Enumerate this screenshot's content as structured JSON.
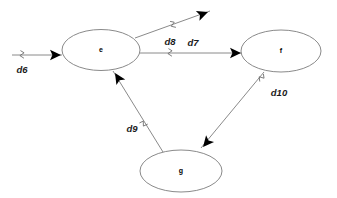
{
  "diagram": {
    "type": "directed-graph",
    "background_color": "#ffffff",
    "node_stroke_color": "#8a8a8a",
    "edge_stroke_color": "#8a8a8a",
    "arrow_color": "#000000",
    "label_color": "#1a1a1a",
    "nodes": [
      {
        "id": "e",
        "label": "e",
        "cx": 101,
        "cy": 50,
        "rx": 39,
        "ry": 20.5
      },
      {
        "id": "f",
        "label": "f",
        "cx": 281,
        "cy": 51,
        "rx": 40,
        "ry": 21
      },
      {
        "id": "g",
        "label": "g",
        "cx": 181,
        "cy": 171,
        "rx": 41,
        "ry": 21
      }
    ],
    "edges": [
      {
        "id": "d6",
        "label": "d6",
        "from": "",
        "to": "e",
        "label_x": 22,
        "label_y": 70,
        "x1": 12,
        "y1": 55,
        "x2": 62,
        "y2": 55,
        "tick_x": 22,
        "tick_y": 55,
        "tick_angle": 0,
        "arrow_x": 61,
        "arrow_y": 55,
        "arrow_angle": 0
      },
      {
        "id": "d8",
        "label": "d8",
        "from": "e",
        "to": "",
        "label_x": 170,
        "label_y": 42,
        "x1": 135,
        "y1": 38,
        "x2": 210,
        "y2": 11,
        "tick_x": 173,
        "tick_y": 25,
        "tick_angle": -20,
        "arrow_x": 208,
        "arrow_y": 12,
        "arrow_angle": -20
      },
      {
        "id": "d7",
        "label": "d7",
        "from": "e",
        "to": "f",
        "label_x": 193,
        "label_y": 43,
        "x1": 140,
        "y1": 53,
        "x2": 242,
        "y2": 53,
        "tick_x": 170,
        "tick_y": 53,
        "tick_angle": 0,
        "arrow_x": 241,
        "arrow_y": 53,
        "arrow_angle": 0
      },
      {
        "id": "d10",
        "label": "d10",
        "from": "f",
        "to": "g",
        "label_x": 279,
        "label_y": 93,
        "x1": 264,
        "y1": 72,
        "x2": 201,
        "y2": 148,
        "tick_x": 261,
        "tick_y": 78,
        "tick_angle": 50,
        "arrow_x": 203,
        "arrow_y": 147,
        "arrow_angle": 130
      },
      {
        "id": "d9",
        "label": "d9",
        "from": "g",
        "to": "e",
        "label_x": 132,
        "label_y": 129,
        "x1": 163,
        "y1": 152,
        "x2": 113,
        "y2": 71,
        "tick_x": 144,
        "tick_y": 124,
        "tick_angle": -58,
        "arrow_x": 115,
        "arrow_y": 73,
        "arrow_angle": -122
      }
    ]
  }
}
